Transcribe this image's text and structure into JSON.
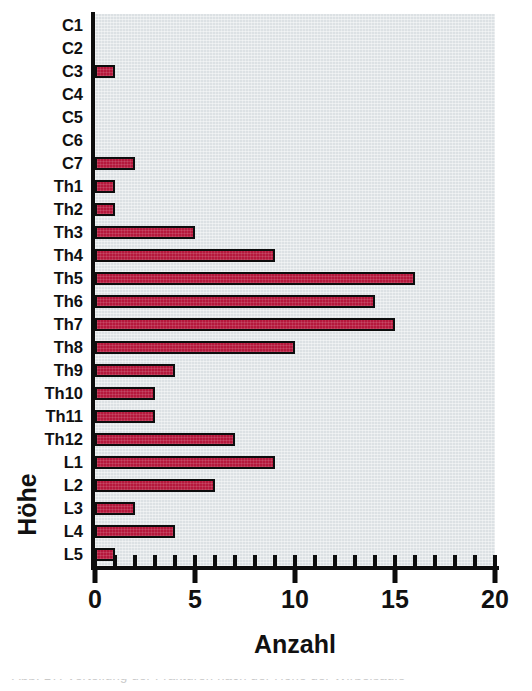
{
  "chart_data": {
    "type": "bar",
    "orientation": "horizontal",
    "title": "",
    "xlabel": "Anzahl",
    "ylabel": "Höhe",
    "xlim": [
      0,
      20
    ],
    "xticks": [
      0,
      5,
      10,
      15,
      20
    ],
    "xtick_labels": [
      "0",
      "5",
      "10",
      "15",
      "20"
    ],
    "x_minor_tick_step": 1,
    "grid": false,
    "legend": null,
    "categories": [
      "C1",
      "C2",
      "C3",
      "C4",
      "C5",
      "C6",
      "C7",
      "Th1",
      "Th2",
      "Th3",
      "Th4",
      "Th5",
      "Th6",
      "Th7",
      "Th8",
      "Th9",
      "Th10",
      "Th11",
      "Th12",
      "L1",
      "L2",
      "L3",
      "L4",
      "L5"
    ],
    "values": [
      0,
      0,
      1,
      0,
      0,
      0,
      2,
      1,
      1,
      5,
      9,
      16,
      14,
      15,
      10,
      4,
      3,
      3,
      7,
      9,
      6,
      2,
      4,
      1
    ],
    "bar_color": "#b5183c",
    "bar_edge_color": "#0d0d0d",
    "plot_background": "#dce1e4",
    "figure_background": "#ffffff",
    "axis_color": "#0d0d0d"
  },
  "caption": {
    "cut_off_text": "Abb. 17: Verteilung der Frakturen nach der Höhe der Wirbelsäule"
  }
}
